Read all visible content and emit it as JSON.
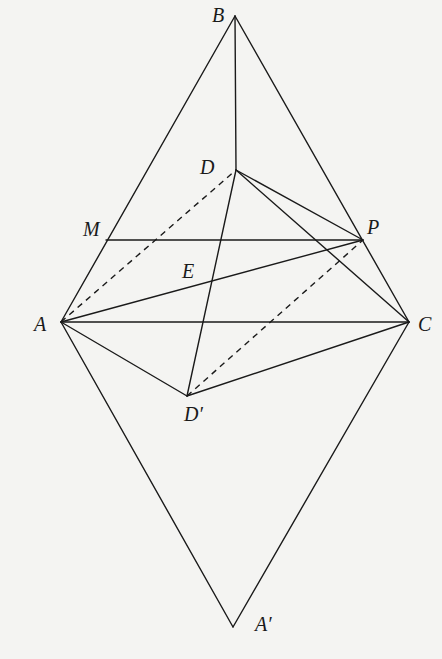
{
  "diagram": {
    "type": "geometry-figure",
    "points": {
      "B": {
        "label": "B",
        "x": 235,
        "y": 16,
        "lx": 212,
        "ly": 22
      },
      "D": {
        "label": "D",
        "x": 236,
        "y": 170,
        "lx": 200,
        "ly": 174
      },
      "M": {
        "label": "M",
        "x": 106,
        "y": 240,
        "lx": 83,
        "ly": 236
      },
      "P": {
        "label": "P",
        "x": 363,
        "y": 240,
        "lx": 367,
        "ly": 234
      },
      "E": {
        "label": "E",
        "x": 0,
        "y": 0,
        "lx": 182,
        "ly": 278
      },
      "A": {
        "label": "A",
        "x": 61,
        "y": 322,
        "lx": 34,
        "ly": 331
      },
      "C": {
        "label": "C",
        "x": 409,
        "y": 322,
        "lx": 418,
        "ly": 331
      },
      "Dp": {
        "label": "D′",
        "x": 187,
        "y": 396,
        "lx": 184,
        "ly": 421
      },
      "Ap": {
        "label": "A′",
        "x": 233,
        "y": 627,
        "lx": 255,
        "ly": 631
      }
    },
    "solid_segments": [
      [
        "A",
        "B"
      ],
      [
        "B",
        "C"
      ],
      [
        "B",
        "D"
      ],
      [
        "M",
        "P"
      ],
      [
        "A",
        "C"
      ],
      [
        "A",
        "Ap"
      ],
      [
        "C",
        "Ap"
      ],
      [
        "A",
        "P"
      ],
      [
        "D",
        "P"
      ],
      [
        "D",
        "C"
      ],
      [
        "D",
        "Dp"
      ],
      [
        "A",
        "Dp"
      ],
      [
        "Dp",
        "C"
      ]
    ],
    "dashed_segments": [
      [
        "A",
        "D"
      ],
      [
        "Dp",
        "P"
      ]
    ],
    "labels": [
      "B",
      "D",
      "M",
      "P",
      "E",
      "A",
      "C",
      "D′",
      "A′"
    ]
  }
}
